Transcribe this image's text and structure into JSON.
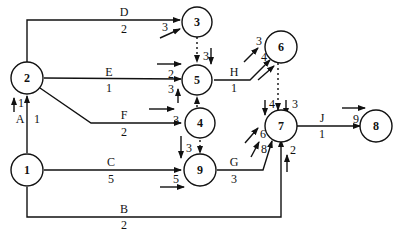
{
  "diagram": {
    "type": "activity-on-arrow network",
    "nodes": [
      {
        "id": "1",
        "label": "1"
      },
      {
        "id": "2",
        "label": "2"
      },
      {
        "id": "3",
        "label": "3"
      },
      {
        "id": "4",
        "label": "4"
      },
      {
        "id": "5",
        "label": "5"
      },
      {
        "id": "6",
        "label": "6"
      },
      {
        "id": "7",
        "label": "7"
      },
      {
        "id": "8",
        "label": "8"
      },
      {
        "id": "9",
        "label": "9"
      }
    ],
    "activities": [
      {
        "name": "A",
        "from": "1",
        "to": "2",
        "duration": "1"
      },
      {
        "name": "B",
        "from": "1",
        "to": "7",
        "duration": "2"
      },
      {
        "name": "C",
        "from": "1",
        "to": "9",
        "duration": "5"
      },
      {
        "name": "D",
        "from": "2",
        "to": "3",
        "duration": "2"
      },
      {
        "name": "E",
        "from": "2",
        "to": "5",
        "duration": "1"
      },
      {
        "name": "F",
        "from": "2",
        "to": "4",
        "duration": "2"
      },
      {
        "name": "G",
        "from": "9",
        "to": "7",
        "duration": "3"
      },
      {
        "name": "H",
        "from": "5",
        "to": "6",
        "duration": "1"
      },
      {
        "name": "J",
        "from": "7",
        "to": "8",
        "duration": "1"
      }
    ],
    "dummies": [
      {
        "from": "3",
        "to": "5"
      },
      {
        "from": "4",
        "to": "5"
      },
      {
        "from": "4",
        "to": "9"
      },
      {
        "from": "6",
        "to": "7"
      }
    ],
    "event_times": {
      "node2_in": "1",
      "node3_in": "3",
      "node5_in_top": "3",
      "node5_in_E": "2",
      "node5_in_F": "3",
      "node4_in": "3",
      "node9_in_dummy": "3",
      "node9_in_C": "5",
      "node6_in_top": "3",
      "node6_in_H": "4",
      "node7_in_6a": "4",
      "node7_in_6b": "3",
      "node7_in_G_a": "6",
      "node7_in_G_b": "8",
      "node7_in_B": "2",
      "node8_in": "9"
    }
  }
}
